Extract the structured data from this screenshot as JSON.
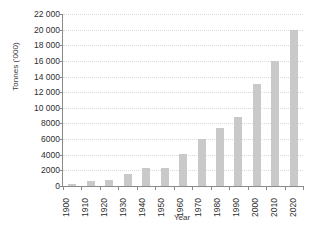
{
  "chart_data": {
    "type": "bar",
    "title": "",
    "xlabel": "Year",
    "ylabel": "Tonnes ('000)",
    "categories": [
      "1900",
      "1910",
      "1920",
      "1930",
      "1940",
      "1950",
      "1960",
      "1970",
      "1980",
      "1990",
      "2000",
      "2010",
      "2020"
    ],
    "values": [
      300,
      700,
      800,
      1500,
      2300,
      2300,
      4100,
      6000,
      7400,
      8800,
      13000,
      16000,
      20000
    ],
    "ylim": [
      0,
      22000
    ],
    "ytick_values": [
      0,
      2000,
      4000,
      6000,
      8000,
      10000,
      12000,
      14000,
      16000,
      18000,
      20000,
      22000
    ],
    "ytick_labels": [
      "0",
      "2000",
      "4000",
      "6000",
      "8000",
      "10 000",
      "12 000",
      "14 000",
      "16 000",
      "18 000",
      "20 000",
      "22 000"
    ],
    "grid": true,
    "grid_color": "#d9d9d9",
    "bar_color": "#c9c9c9",
    "axis_color": "#8a8a8a",
    "legend": null,
    "legend_position": "none"
  }
}
